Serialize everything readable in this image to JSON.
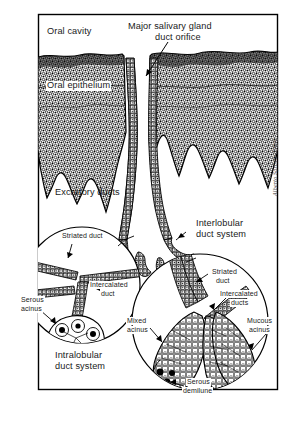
{
  "figure": {
    "type": "histology-illustration",
    "frame": {
      "x": 38,
      "y": 14,
      "width": 240,
      "height": 376,
      "border_color": "#000000"
    },
    "background_color": "#ffffff",
    "ink_color": "#000000",
    "signature": "Alberto Sgrosso-Entec"
  },
  "labels": {
    "oral_cavity": "Oral cavity",
    "duct_orifice_line1": "Major salivary gland",
    "duct_orifice_line2": "duct orifice",
    "oral_epithelium": "Oral epithelium",
    "excretory_ducts": "Excretory ducts",
    "interlobular_line1": "Interlobular",
    "interlobular_line2": "duct system",
    "intralobular_line1": "Intralobular",
    "intralobular_line2": "duct system",
    "striated_duct_left": "Striated duct",
    "intercalated_duct_left_line1": "Intercalated",
    "intercalated_duct_left_line2": "duct",
    "serous_acinus_line1": "Serous",
    "serous_acinus_line2": "acinus",
    "striated_duct_right_line1": "Striated",
    "striated_duct_right_line2": "duct",
    "intercalated_ducts_right_line1": "Intercalated",
    "intercalated_ducts_right_line2": "ducts",
    "mixed_acinus_line1": "Mixed",
    "mixed_acinus_line2": "acinus",
    "mucous_acinus_line1": "Mucous",
    "mucous_acinus_line2": "acinus",
    "serous_demilune_line1": "Serous",
    "serous_demilune_line2": "demilune"
  },
  "insets": [
    {
      "name": "intralobular-inset",
      "cx": 82,
      "cy": 285,
      "r": 58,
      "caption": "Intralobular duct system"
    },
    {
      "name": "interlobular-inset",
      "cx": 200,
      "cy": 322,
      "r": 68,
      "caption": "Interlobular duct system"
    }
  ],
  "structures": [
    "oral epithelium band",
    "major salivary gland duct orifice",
    "excretory ducts",
    "striated duct",
    "intercalated duct",
    "serous acinus",
    "mixed acinus",
    "mucous acinus",
    "serous demilune"
  ]
}
